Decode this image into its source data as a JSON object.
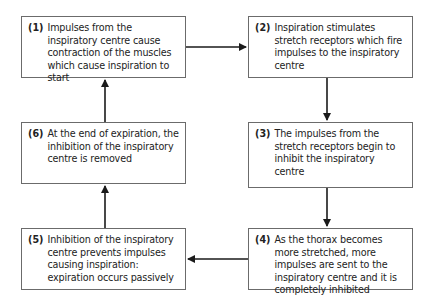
{
  "diagram": {
    "type": "cycle-flowchart",
    "nodes": [
      {
        "id": 1,
        "label": "(1)",
        "text": "Impulses from the inspiratory centre cause contraction of the muscles which cause inspiration to start"
      },
      {
        "id": 2,
        "label": "(2)",
        "text": "Inspiration stimulates stretch receptors which fire impulses to the inspiratory centre"
      },
      {
        "id": 3,
        "label": "(3)",
        "text": "The impulses from the stretch receptors begin to inhibit the inspiratory centre"
      },
      {
        "id": 4,
        "label": "(4)",
        "text": "As the thorax becomes more stretched, more impulses are sent to the inspiratory centre and it is completely inhibited"
      },
      {
        "id": 5,
        "label": "(5)",
        "text": "Inhibition of the inspiratory centre prevents impulses causing inspiration: expiration occurs passively"
      },
      {
        "id": 6,
        "label": "(6)",
        "text": "At the end of expiration, the inhibition of the inspiratory centre is removed"
      }
    ],
    "edges": [
      {
        "from": 1,
        "to": 2,
        "direction": "right"
      },
      {
        "from": 2,
        "to": 3,
        "direction": "down"
      },
      {
        "from": 3,
        "to": 4,
        "direction": "down"
      },
      {
        "from": 4,
        "to": 5,
        "direction": "left"
      },
      {
        "from": 5,
        "to": 6,
        "direction": "up"
      },
      {
        "from": 6,
        "to": 1,
        "direction": "up"
      }
    ],
    "colors": {
      "border": "#6b6b6b",
      "arrow": "#1a1a1a",
      "text": "#222222",
      "background": "#ffffff"
    }
  }
}
